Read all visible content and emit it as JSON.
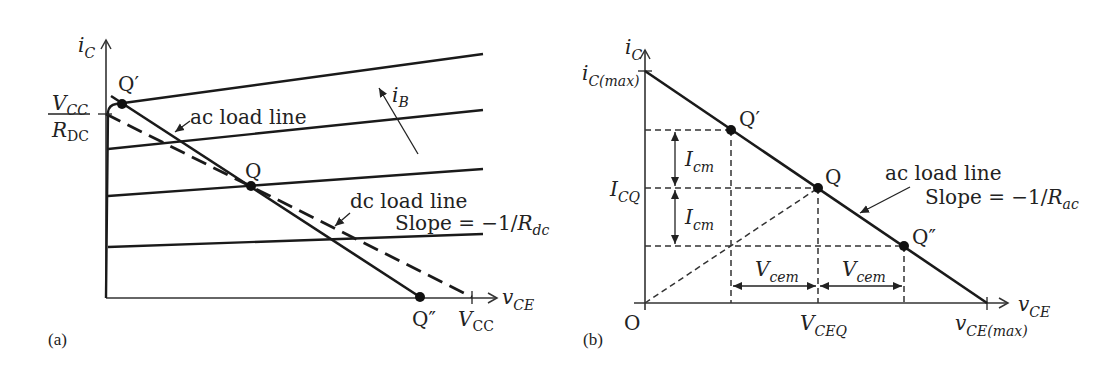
{
  "panel_a": {
    "label": "(a)",
    "y_axis": {
      "main": "i",
      "sub": "C"
    },
    "x_axis": {
      "main": "v",
      "sub": "CE"
    },
    "vcc_over_rdc": {
      "num_main": "V",
      "num_sub": "CC",
      "den_main": "R",
      "den_sub": "DC"
    },
    "vcc_tick": {
      "main": "V",
      "sub": "CC"
    },
    "points": {
      "q_prime": "Q′",
      "q": "Q",
      "q_double_prime": "Q″"
    },
    "ac_load_line_label": "ac load line",
    "dc_load_line_label": "dc load line",
    "dc_slope_label": {
      "text": "Slope = −1/",
      "main": "R",
      "sub": "dc"
    },
    "ib_label": {
      "main": "i",
      "sub": "B"
    },
    "characteristic_curves": 4
  },
  "panel_b": {
    "label": "(b)",
    "y_axis": {
      "main": "i",
      "sub": "C"
    },
    "x_axis": {
      "main": "v",
      "sub": "CE"
    },
    "origin": "O",
    "ic_max": {
      "main": "i",
      "sub": "C(max)"
    },
    "icq": {
      "main": "I",
      "sub": "CQ"
    },
    "icm_upper": {
      "main": "I",
      "sub": "cm"
    },
    "icm_lower": {
      "main": "I",
      "sub": "cm"
    },
    "vceq": {
      "main": "V",
      "sub": "CEQ"
    },
    "vcem_left": {
      "main": "V",
      "sub": "cem"
    },
    "vcem_right": {
      "main": "V",
      "sub": "cem"
    },
    "vce_max": {
      "main": "v",
      "sub": "CE(max)"
    },
    "points": {
      "q_prime": "Q′",
      "q": "Q",
      "q_double_prime": "Q″"
    },
    "ac_load_line_label": "ac load line",
    "ac_slope_label": {
      "text": "Slope = −1/",
      "main": "R",
      "sub": "ac"
    }
  }
}
